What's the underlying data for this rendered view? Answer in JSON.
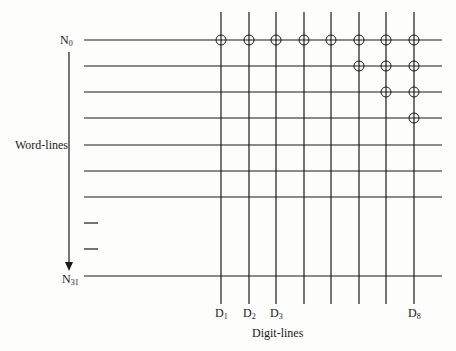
{
  "diagram": {
    "axis_labels": {
      "word_lines": "Word-lines",
      "digit_lines": "Digit-lines"
    },
    "word_line_labels": {
      "first": {
        "base": "N",
        "sub": "0"
      },
      "last": {
        "base": "N",
        "sub": "31"
      }
    },
    "digit_line_labels": [
      {
        "base": "D",
        "sub": "1",
        "index": 0
      },
      {
        "base": "D",
        "sub": "2",
        "index": 1
      },
      {
        "base": "D",
        "sub": "3",
        "index": 2
      },
      {
        "base": "D",
        "sub": "8",
        "index": 7
      }
    ],
    "word_lines_y": [
      40,
      66,
      92,
      118,
      145,
      171,
      197
    ],
    "ellipsis_dashes_y": [
      223,
      249
    ],
    "last_word_line_y": 276,
    "digit_lines_x": [
      221,
      249,
      276,
      304,
      331,
      359,
      386,
      414
    ],
    "crosspoints": [
      {
        "row": 0,
        "cols": [
          0,
          1,
          2,
          3,
          4,
          5,
          6,
          7
        ]
      },
      {
        "row": 1,
        "cols": [
          5,
          6,
          7
        ]
      },
      {
        "row": 2,
        "cols": [
          6,
          7
        ]
      },
      {
        "row": 3,
        "cols": [
          7
        ]
      }
    ],
    "colors": {
      "line": "#1a1a1a",
      "background": "#fdfdfc"
    }
  }
}
